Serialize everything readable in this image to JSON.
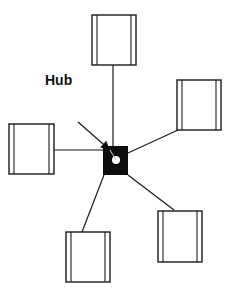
{
  "diagram": {
    "hub_label": "Hub",
    "hub_label_pos": {
      "x": 45,
      "y": 73
    },
    "colors": {
      "stroke": "#1a1a1a",
      "fill_hub": "#0d0d0d",
      "hub_dot": "#ffffff",
      "background": "#ffffff"
    },
    "hub": {
      "x": 103,
      "y": 146,
      "w": 25,
      "h": 29,
      "dot": {
        "cx": 116,
        "cy": 160,
        "r": 4
      }
    },
    "arrow": {
      "x1": 78,
      "y1": 122,
      "x2": 110,
      "y2": 150
    },
    "nodes": [
      {
        "id": "top",
        "x": 92,
        "y": 15,
        "w": 44,
        "h": 50,
        "link": {
          "x1": 113,
          "y1": 65,
          "x2": 113,
          "y2": 146
        }
      },
      {
        "id": "right",
        "x": 177,
        "y": 80,
        "w": 44,
        "h": 50,
        "link": {
          "x1": 178,
          "y1": 130,
          "x2": 128,
          "y2": 153
        }
      },
      {
        "id": "left",
        "x": 9,
        "y": 124,
        "w": 45,
        "h": 50,
        "link": {
          "x1": 54,
          "y1": 150,
          "x2": 103,
          "y2": 150
        }
      },
      {
        "id": "bottom-right",
        "x": 158,
        "y": 211,
        "w": 44,
        "h": 51,
        "link": {
          "x1": 174,
          "y1": 210,
          "x2": 128,
          "y2": 175
        }
      },
      {
        "id": "bottom-left",
        "x": 66,
        "y": 232,
        "w": 44,
        "h": 50,
        "link": {
          "x1": 82,
          "y1": 232,
          "x2": 104,
          "y2": 175
        }
      }
    ],
    "node_inset": 5
  }
}
